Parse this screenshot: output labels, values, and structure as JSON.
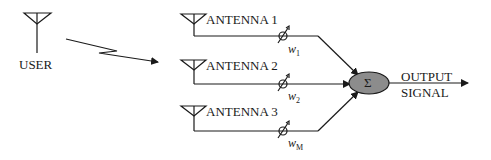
{
  "diagram": {
    "type": "smart-antenna beamforming block diagram",
    "user": {
      "label": "USER"
    },
    "antennas": [
      {
        "label": "ANTENNA 1",
        "weight": "w",
        "weight_sub": "1"
      },
      {
        "label": "ANTENNA 2",
        "weight": "w",
        "weight_sub": "2"
      },
      {
        "label": "ANTENNA 3",
        "weight": "w",
        "weight_sub": "M"
      }
    ],
    "summer": {
      "symbol": "Σ",
      "fill": "#8c8c8c"
    },
    "output": {
      "line1": "OUTPUT",
      "line2": "SIGNAL"
    },
    "colors": {
      "stroke": "#1a1a1a",
      "background": "#ffffff"
    }
  }
}
